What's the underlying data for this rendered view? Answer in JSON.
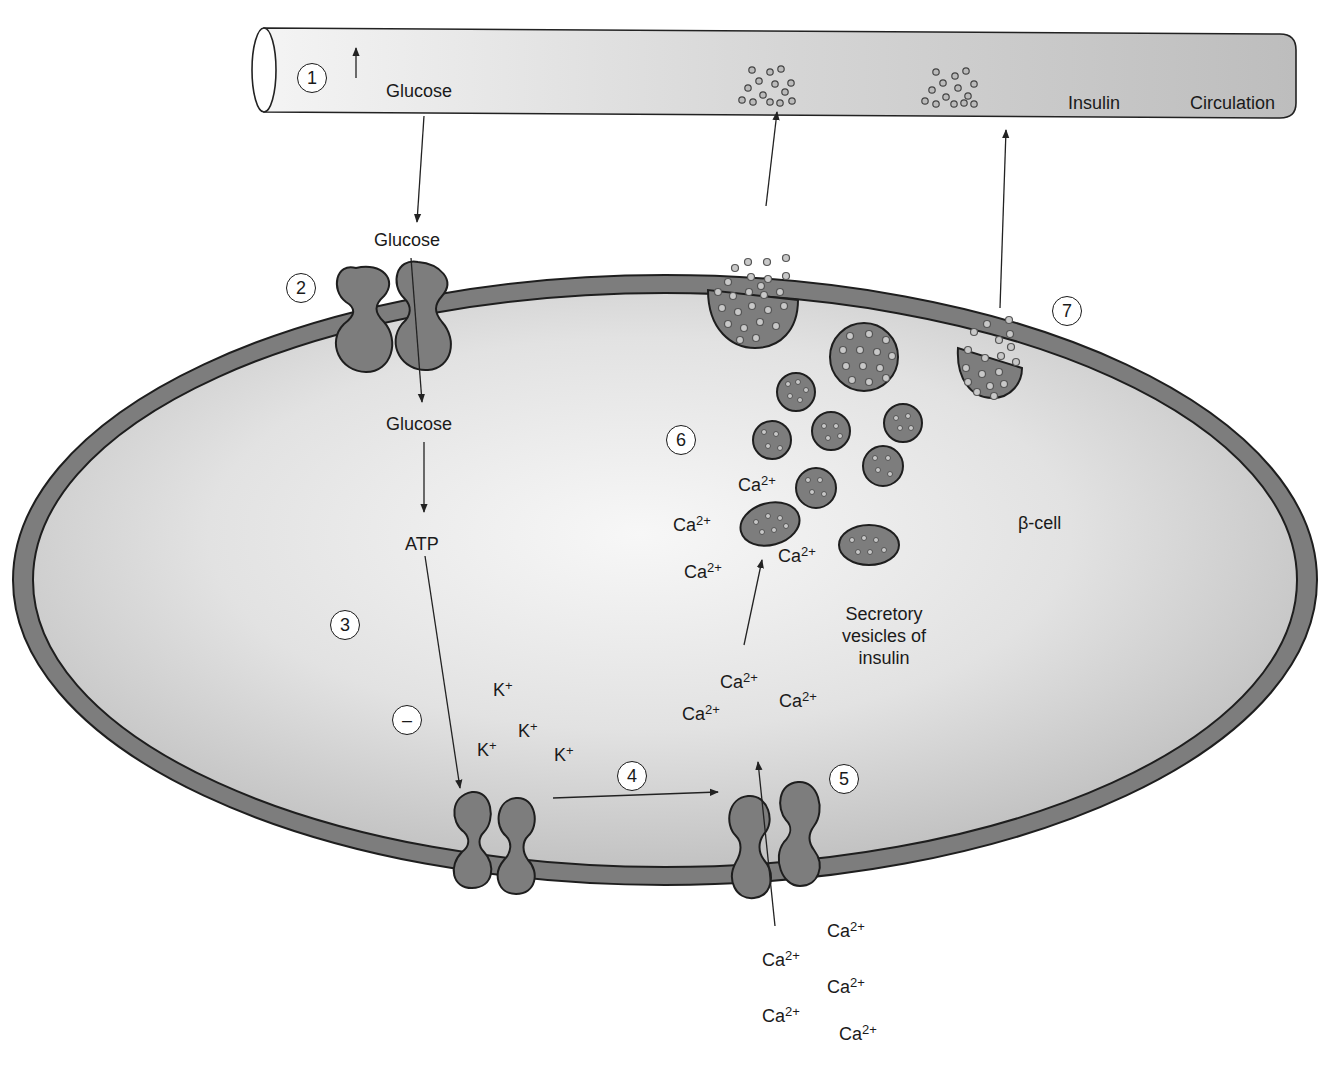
{
  "diagram": {
    "colors": {
      "membrane": "#7d7d7d",
      "membrane_outline": "#1e1e1e",
      "cytoplasm_light": "#f2f2f2",
      "cytoplasm_dark": "#c4c4c4",
      "vessel": "#cfcfcf",
      "vesicle": "#808080",
      "granule": "#c8c8c8",
      "text": "#1a1a1a"
    },
    "blood_vessel": {
      "glucose_label": "Glucose",
      "increase_arrow": "↑",
      "insulin_label": "Insulin",
      "circulation_label": "Circulation"
    },
    "steps": [
      {
        "number": "1",
        "meaning": "Blood glucose rises"
      },
      {
        "number": "2",
        "meaning": "Glucose enters via transporter"
      },
      {
        "number": "3",
        "meaning": "ATP produced by metabolism"
      },
      {
        "number": "–",
        "meaning": "ATP inhibits K+ channel"
      },
      {
        "number": "4",
        "meaning": "K+ channel closure depolarizes membrane"
      },
      {
        "number": "5",
        "meaning": "Voltage-gated Ca2+ channel opens"
      },
      {
        "number": "6",
        "meaning": "Ca2+ triggers vesicle movement"
      },
      {
        "number": "7",
        "meaning": "Insulin exocytosis into circulation"
      }
    ],
    "labels": {
      "glucose_outside": "Glucose",
      "glucose_inside": "Glucose",
      "atp": "ATP",
      "beta_cell": "β-cell",
      "vesicles_line1": "Secretory",
      "vesicles_line2": "vesicles of",
      "vesicles_line3": "insulin"
    },
    "ions": {
      "potassium": {
        "base": "K",
        "charge": "+"
      },
      "calcium": {
        "base": "Ca",
        "charge": "2+"
      }
    }
  }
}
